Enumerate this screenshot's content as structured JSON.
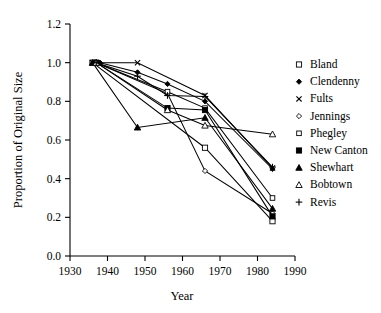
{
  "chart_data": {
    "type": "line",
    "title": "",
    "xlabel": "Year",
    "ylabel": "Proportion of Original Size",
    "xlim": [
      1930,
      1990
    ],
    "ylim": [
      0.0,
      1.2
    ],
    "xticks": [
      1930,
      1940,
      1950,
      1960,
      1970,
      1980,
      1990
    ],
    "xtick_labels": [
      "1930",
      "1940",
      "1950",
      "1960",
      "1970",
      "1980",
      "1990"
    ],
    "yticks": [
      0.0,
      0.2,
      0.4,
      0.6,
      0.8,
      1.0,
      1.2
    ],
    "ytick_labels": [
      "0.0",
      "0.2",
      "0.4",
      "0.6",
      "0.8",
      "1.0",
      "1.2"
    ],
    "grid": false,
    "legend_position": "right",
    "series": [
      {
        "name": "Bland",
        "marker": "open-square",
        "x": [
          1936,
          1966,
          1984
        ],
        "values": [
          1.0,
          0.56,
          0.18
        ]
      },
      {
        "name": "Clendenny",
        "marker": "filled-diamond",
        "x": [
          1938,
          1948,
          1956,
          1966,
          1984
        ],
        "values": [
          1.0,
          0.95,
          0.89,
          0.8,
          0.45
        ]
      },
      {
        "name": "Fults",
        "marker": "x-cross",
        "x": [
          1936,
          1948,
          1966,
          1984
        ],
        "values": [
          1.0,
          1.0,
          0.83,
          0.455
        ]
      },
      {
        "name": "Jennings",
        "marker": "open-diamond",
        "x": [
          1937,
          1956,
          1966,
          1984
        ],
        "values": [
          1.0,
          0.84,
          0.44,
          0.22
        ]
      },
      {
        "name": "Phegley",
        "marker": "open-square-small",
        "x": [
          1937,
          1956,
          1966,
          1984
        ],
        "values": [
          1.0,
          0.85,
          0.765,
          0.3
        ]
      },
      {
        "name": "New Canton",
        "marker": "filled-square",
        "x": [
          1937,
          1956,
          1966,
          1984
        ],
        "values": [
          1.0,
          0.765,
          0.755,
          0.205
        ]
      },
      {
        "name": "Shewhart",
        "marker": "filled-triangle",
        "x": [
          1936,
          1948,
          1966,
          1984
        ],
        "values": [
          1.0,
          0.665,
          0.715,
          0.245
        ]
      },
      {
        "name": "Bobtown",
        "marker": "open-triangle",
        "x": [
          1937,
          1956,
          1966,
          1984
        ],
        "values": [
          1.0,
          0.755,
          0.675,
          0.63
        ]
      },
      {
        "name": "Revis",
        "marker": "plus",
        "x": [
          1937,
          1948,
          1956,
          1966,
          1984
        ],
        "values": [
          1.0,
          0.93,
          0.83,
          0.825,
          0.46
        ]
      }
    ]
  },
  "legend": {
    "items": [
      {
        "label": "Bland"
      },
      {
        "label": "Clendenny"
      },
      {
        "label": "Fults"
      },
      {
        "label": "Jennings"
      },
      {
        "label": "Phegley"
      },
      {
        "label": "New Canton"
      },
      {
        "label": "Shewhart"
      },
      {
        "label": "Bobtown"
      },
      {
        "label": "Revis"
      }
    ]
  }
}
